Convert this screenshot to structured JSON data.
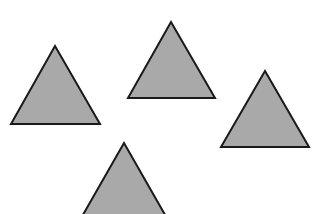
{
  "canvas": {
    "width": 313,
    "height": 214,
    "background": "#ffffff"
  },
  "style": {
    "fill": "#a9a9a9",
    "stroke": "#1a1a1a",
    "stroke_width": 2
  },
  "shapes": [
    {
      "name": "triangle-left",
      "type": "triangle",
      "points": [
        [
          55,
          46
        ],
        [
          11,
          124
        ],
        [
          100,
          124
        ]
      ]
    },
    {
      "name": "triangle-top",
      "type": "triangle",
      "points": [
        [
          171,
          22
        ],
        [
          128,
          98
        ],
        [
          215,
          98
        ]
      ]
    },
    {
      "name": "triangle-right",
      "type": "triangle",
      "points": [
        [
          265,
          71
        ],
        [
          221,
          147
        ],
        [
          309,
          147
        ]
      ]
    },
    {
      "name": "triangle-bottom",
      "type": "triangle",
      "points": [
        [
          124,
          143
        ],
        [
          80,
          220
        ],
        [
          168,
          220
        ]
      ]
    }
  ]
}
